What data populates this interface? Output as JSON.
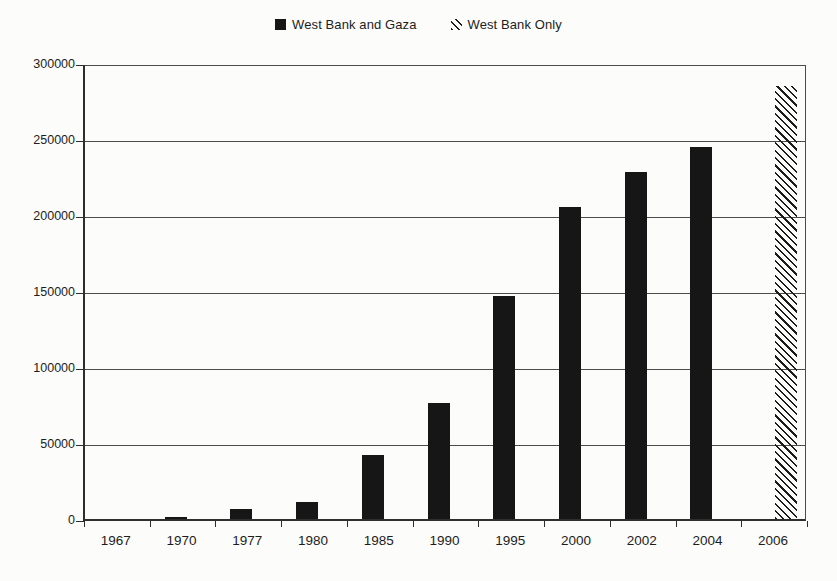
{
  "legend": {
    "items": [
      {
        "label": "West Bank and Gaza",
        "swatch": "solid-black-square-icon"
      },
      {
        "label": "West Bank Only",
        "swatch": "diagonal-hatch-icon"
      }
    ]
  },
  "chart_data": {
    "type": "bar",
    "title": "",
    "xlabel": "",
    "ylabel": "",
    "categories": [
      "1967",
      "1970",
      "1977",
      "1980",
      "1985",
      "1990",
      "1995",
      "2000",
      "2002",
      "2004",
      "2006"
    ],
    "series": [
      {
        "name": "West Bank and Gaza",
        "pattern": "solid",
        "color": "#161616",
        "values": [
          0,
          1500,
          6500,
          11500,
          42000,
          76000,
          147000,
          205000,
          228000,
          245000,
          null
        ]
      },
      {
        "name": "West Bank Only",
        "pattern": "diagonal-hatch",
        "color": "#1c1c1c",
        "values": [
          null,
          null,
          null,
          null,
          null,
          null,
          null,
          null,
          null,
          null,
          285000
        ]
      }
    ],
    "ylim": [
      0,
      300000
    ],
    "ytick_interval": 50000,
    "ytick_labels": [
      "0",
      "50000",
      "100000",
      "150000",
      "200000",
      "250000",
      "300000"
    ],
    "grid": true,
    "plot_border": true,
    "legend_position": "top-center"
  },
  "colors": {
    "bar_solid": "#161616",
    "hatch_stroke": "#1c1c1c",
    "gridline": "#4c4c4c",
    "axis": "#2e2e2e",
    "background": "#fcfcfa",
    "text": "#1d1d1d"
  }
}
